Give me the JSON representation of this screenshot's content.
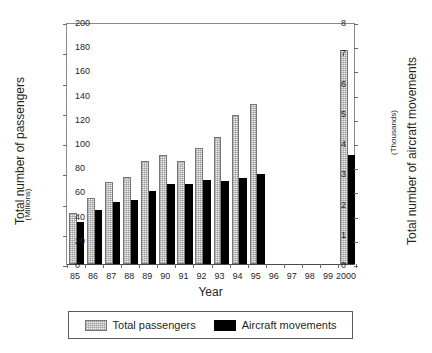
{
  "chart_data": {
    "type": "bar",
    "title": "",
    "xlabel": "Year",
    "ylabel": "Total number of passengers",
    "ylabel_unit": "(Millions)",
    "y2label": "Total number of aircraft movements",
    "y2label_unit": "(Thousands)",
    "ylim": [
      0,
      8
    ],
    "y2lim": [
      0,
      200
    ],
    "yticks": [
      "0",
      "1",
      "2",
      "3",
      "4",
      "5",
      "6",
      "7",
      "8"
    ],
    "ytick_values": [
      0,
      1,
      2,
      3,
      4,
      5,
      6,
      7,
      8
    ],
    "y2ticks": [
      "0",
      "20",
      "40",
      "60",
      "80",
      "100",
      "120",
      "140",
      "160",
      "180",
      "200"
    ],
    "y2tick_values": [
      0,
      20,
      40,
      60,
      80,
      100,
      120,
      140,
      160,
      180,
      200
    ],
    "grid": false,
    "legend_position": "bottom",
    "categories": [
      "85",
      "86",
      "87",
      "88",
      "89",
      "90",
      "91",
      "92",
      "93",
      "94",
      "95",
      "96",
      "97",
      "98",
      "99",
      "2000"
    ],
    "series": [
      {
        "name": "Total passengers",
        "axis": "left",
        "unit": "Millions",
        "color": "#efefef",
        "values": [
          1.7,
          2.17,
          2.72,
          2.87,
          3.42,
          3.62,
          3.4,
          3.82,
          4.2,
          4.93,
          5.3,
          null,
          null,
          null,
          null,
          7.08
        ]
      },
      {
        "name": "Aircraft movements",
        "axis": "right",
        "unit": "Thousands",
        "color": "#000000",
        "values": [
          35,
          44.5,
          51.5,
          52.5,
          60.5,
          66.5,
          66,
          69.5,
          69,
          71,
          74.5,
          null,
          null,
          null,
          null,
          90
        ]
      }
    ]
  },
  "legend": {
    "entries": [
      {
        "label": "Total passengers",
        "swatch": "pax"
      },
      {
        "label": "Aircraft movements",
        "swatch": "acm"
      }
    ]
  }
}
